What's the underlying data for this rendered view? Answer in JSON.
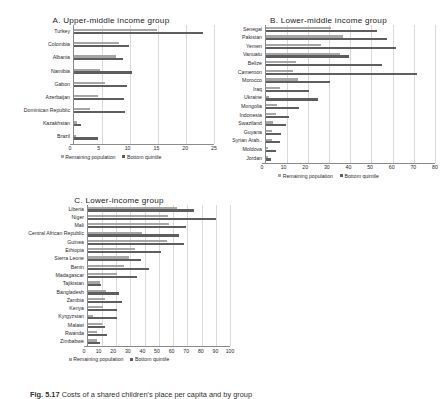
{
  "figure": {
    "caption_label": "Fig. 5.17",
    "caption_text": "Costs of a shared children's place per capita and by group"
  },
  "legend": {
    "remaining_label": "Remaining population",
    "bottom_label": "Bottom quintile"
  },
  "chart_data": [
    {
      "id": "A",
      "type": "bar",
      "orientation": "horizontal",
      "title": "A. Upper-middle income group",
      "xlabel": "",
      "ylabel": "",
      "xlim": [
        0,
        25
      ],
      "xticks": [
        0,
        5,
        10,
        15,
        20,
        25
      ],
      "grid": true,
      "legend_position": "bottom",
      "categories": [
        "Turkey",
        "Colombia",
        "Albania",
        "Namibia",
        "Gabon",
        "Azerbaijan",
        "Dominican Republic",
        "Kazakhstan",
        "Brazil"
      ],
      "series": [
        {
          "name": "Remaining population",
          "color": "#a6a6a6",
          "values": [
            14.9,
            8.1,
            7.6,
            4.8,
            5.6,
            4.4,
            2.9,
            0.7,
            0.5
          ]
        },
        {
          "name": "Bottom quintile",
          "color": "#5e5e5e",
          "values": [
            23.1,
            9.9,
            8.8,
            10.4,
            9.6,
            9.0,
            9.1,
            1.3,
            4.4
          ]
        }
      ]
    },
    {
      "id": "B",
      "type": "bar",
      "orientation": "horizontal",
      "title": "B. Lower-middle income group",
      "xlabel": "",
      "ylabel": "",
      "xlim": [
        0,
        80
      ],
      "xticks": [
        0,
        10,
        20,
        30,
        40,
        50,
        60,
        70,
        80
      ],
      "grid": true,
      "legend_position": "bottom",
      "categories": [
        "Senegal",
        "Pakistan",
        "Yemen",
        "Vanuatu",
        "Belize",
        "Cameroon",
        "Morocco",
        "Iraq",
        "Ukraine",
        "Mongolia",
        "Indonesia",
        "Swaziland",
        "Guyana",
        "Syrian Arab..",
        "Moldova",
        "Jordan"
      ],
      "series": [
        {
          "name": "Remaining population",
          "color": "#a6a6a6",
          "values": [
            31.0,
            36.5,
            26.0,
            35.0,
            14.5,
            13.0,
            15.5,
            7.0,
            1.5,
            5.5,
            5.0,
            3.5,
            3.0,
            3.0,
            1.0,
            1.0
          ]
        },
        {
          "name": "Bottom quintile",
          "color": "#5e5e5e",
          "values": [
            52.5,
            57.5,
            61.5,
            39.5,
            55.0,
            71.5,
            30.5,
            20.5,
            25.0,
            16.0,
            11.0,
            9.5,
            7.5,
            7.0,
            5.0,
            2.5
          ]
        }
      ]
    },
    {
      "id": "C",
      "type": "bar",
      "orientation": "horizontal",
      "title": "C. Lower-income group",
      "xlabel": "",
      "ylabel": "",
      "xlim": [
        0,
        100
      ],
      "xticks": [
        0,
        10,
        20,
        30,
        40,
        50,
        60,
        70,
        80,
        90,
        100
      ],
      "grid": true,
      "legend_position": "bottom",
      "categories": [
        "Liberia",
        "Niger",
        "Mali",
        "Central African Republic",
        "Guinea",
        "Ethiopia",
        "Sierra Leone",
        "Benin",
        "Madagascar",
        "Tajikistan",
        "Bangladesh",
        "Zambia",
        "Kenya",
        "Kyrgyzstan",
        "Malawi",
        "Rwanda",
        "Zimbabwe"
      ],
      "series": [
        {
          "name": "Remaining population",
          "color": "#a6a6a6",
          "values": [
            63.0,
            56.5,
            57.0,
            38.0,
            56.0,
            33.0,
            29.0,
            25.5,
            21.0,
            9.0,
            13.0,
            12.0,
            11.0,
            4.0,
            10.5,
            7.0,
            6.5
          ]
        },
        {
          "name": "Bottom quintile",
          "color": "#5e5e5e",
          "values": [
            74.5,
            90.0,
            69.0,
            64.0,
            67.5,
            51.5,
            37.5,
            43.5,
            35.0,
            9.5,
            22.0,
            24.0,
            21.0,
            20.5,
            12.0,
            13.5,
            9.0
          ]
        }
      ]
    }
  ]
}
